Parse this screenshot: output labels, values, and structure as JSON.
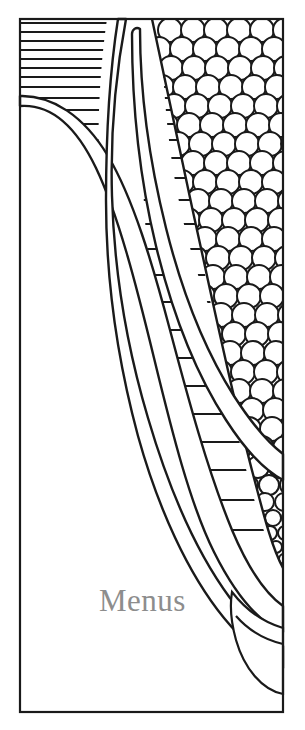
{
  "page": {
    "background_color": "#ffffff",
    "width": 305,
    "height": 730
  },
  "caption": {
    "label": "Menus",
    "color": "#8d8d8d",
    "font_style": "serif",
    "font_size_px": 31
  },
  "artwork": {
    "name": "corn-on-the-cob-line-drawing",
    "style": "coloring-book-outline",
    "stroke_color": "#1a1a1a",
    "fill_color": "#ffffff",
    "frame": {
      "left": 20,
      "top": 19,
      "right": 283,
      "bottom": 712,
      "stroke_width": 2.2
    },
    "elements": [
      {
        "name": "hatched-background",
        "description": "Horizontal ruled lines filling the upper-left field behind the husk",
        "line_y_positions": [
          23,
          32,
          41,
          50,
          59,
          68,
          77,
          87,
          98,
          110,
          124,
          140,
          158,
          178,
          200,
          224,
          249,
          275,
          302,
          330,
          358,
          386,
          414,
          442,
          470,
          500,
          530
        ],
        "stroke_width": 2.0
      },
      {
        "name": "husk-leaf-left",
        "description": "Large outer husk leaf sweeping from upper-left down to lower-right"
      },
      {
        "name": "husk-leaf-center",
        "description": "Tall pointed inner husk leaf rising to the top of the frame"
      },
      {
        "name": "husk-leaf-inner-tip",
        "description": "Narrow pointed husk tip beside the center leaf"
      },
      {
        "name": "corn-cob-body",
        "description": "Ear of corn occupying the right side of the frame"
      },
      {
        "name": "kernel-pattern",
        "description": "Overlapping scalloped circles forming the corn kernels",
        "kernel_diameter_px": 23,
        "row_spacing_px": 19,
        "column_spacing_px": 23
      },
      {
        "name": "cob-tail",
        "description": "Rounded bottom tip of the ear curving off the right edge"
      }
    ]
  }
}
